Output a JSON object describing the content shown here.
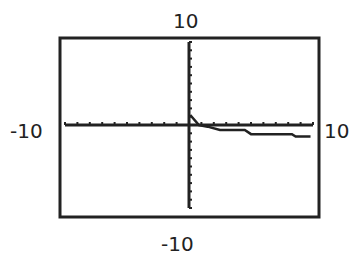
{
  "chart_data": {
    "type": "line",
    "title": "",
    "xlabel": "",
    "ylabel": "",
    "xlim": [
      -10,
      10
    ],
    "ylim": [
      -10,
      10
    ],
    "grid": false,
    "tick_spacing": 1,
    "window_labels": {
      "ymax": "10",
      "ymin": "-10",
      "xmin": "-10",
      "xmax": "10"
    },
    "series": [
      {
        "name": "f(x)",
        "x": [
          0.1,
          0.8,
          1.5,
          2.5,
          4.5,
          5.0,
          8.3,
          8.6,
          9.8
        ],
        "y": [
          1.2,
          0.0,
          -0.2,
          -0.6,
          -0.6,
          -1.1,
          -1.1,
          -1.4,
          -1.4
        ]
      }
    ]
  }
}
